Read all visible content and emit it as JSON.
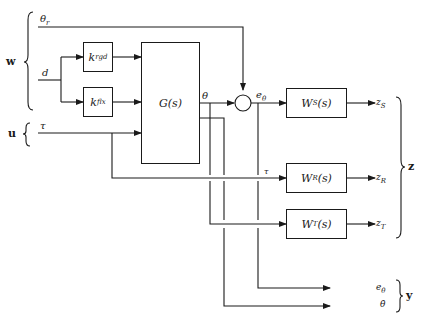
{
  "diagram": {
    "type": "block-diagram",
    "groups": {
      "w": {
        "label": "w",
        "members": [
          "theta_r",
          "d"
        ]
      },
      "u": {
        "label": "u",
        "members": [
          "tau"
        ]
      },
      "z": {
        "label": "z",
        "members": [
          "z_S",
          "z_R",
          "z_T"
        ]
      },
      "y": {
        "label": "y",
        "members": [
          "e_theta",
          "theta_dot"
        ]
      }
    },
    "inputs": {
      "theta_r": {
        "base": "θ",
        "sub": "r"
      },
      "d": {
        "base": "d",
        "sub": ""
      },
      "tau": {
        "base": "τ",
        "sub": ""
      }
    },
    "blocks": {
      "k_rgd": {
        "base": "k",
        "sub": "rgd"
      },
      "k_flx": {
        "base": "k",
        "sub": "flx"
      },
      "G": {
        "base": "G(s)"
      },
      "W_S": {
        "base": "W",
        "sub": "S",
        "suffix": "(s)"
      },
      "W_R": {
        "base": "W",
        "sub": "R",
        "suffix": "(s)"
      },
      "W_T": {
        "base": "W",
        "sub": "T",
        "suffix": "(s)"
      }
    },
    "signals": {
      "theta": "θ",
      "e_theta": {
        "base": "e",
        "sub": "θ"
      },
      "tau_branch": "τ",
      "theta_dot": "θ̇"
    },
    "outputs": {
      "z_S": {
        "base": "z",
        "sub": "S"
      },
      "z_R": {
        "base": "z",
        "sub": "R"
      },
      "z_T": {
        "base": "z",
        "sub": "T"
      },
      "e_theta": {
        "base": "e",
        "sub": "θ"
      },
      "theta_dot": "θ̇"
    },
    "summing_junction": {
      "inputs": [
        "θ",
        "θr"
      ],
      "output": "eθ"
    }
  }
}
